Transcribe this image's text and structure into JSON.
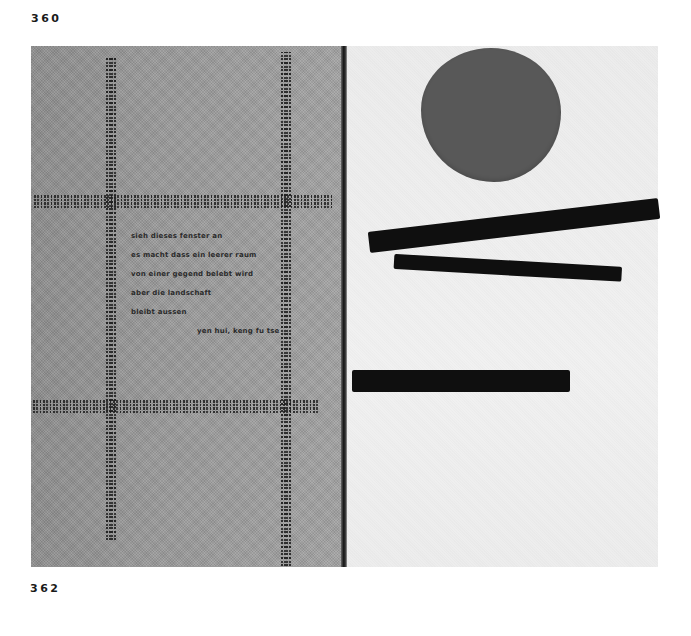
{
  "page_numbers": {
    "top": "360",
    "bottom": "362"
  },
  "left_plate": {
    "poem_lines": [
      "sieh dieses fenster an",
      "es macht dass ein leerer raum",
      "von einer gegend belebt wird",
      "aber die landschaft",
      "bleibt aussen"
    ],
    "author": "yen hui, keng fu tse"
  },
  "right_plate": {
    "shapes": [
      "dark-grey-circle",
      "black-bar-diagonal-upper",
      "black-bar-diagonal-lower",
      "black-bar-horizontal"
    ]
  }
}
